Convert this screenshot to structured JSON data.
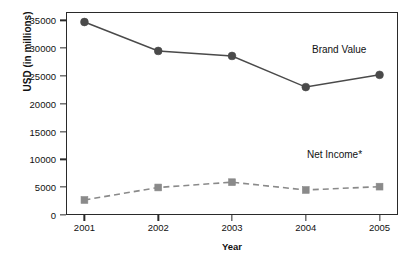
{
  "chart_data": {
    "type": "line",
    "title": "",
    "xlabel": "Year",
    "ylabel": "USD (in millions)",
    "categories": [
      "2001",
      "2002",
      "2003",
      "2004",
      "2005"
    ],
    "x": [
      2001,
      2002,
      2003,
      2004,
      2005
    ],
    "xlim": [
      2000.75,
      2005.25
    ],
    "ylim": [
      0,
      36500
    ],
    "yticks": [
      0,
      5000,
      10000,
      15000,
      20000,
      25000,
      30000,
      35000
    ],
    "ytick_labels": [
      "0",
      "5000",
      "10000",
      "15000",
      "20000",
      "25000",
      "30000",
      "35000"
    ],
    "grid": false,
    "legend_position": "inline-annotations",
    "series": [
      {
        "name": "Brand Value",
        "values": [
          34700,
          29500,
          28600,
          23000,
          25200
        ],
        "marker": "circle",
        "line_style": "solid",
        "color": "#4a4a4a"
      },
      {
        "name": "Net Income*",
        "values": [
          2700,
          4950,
          5900,
          4500,
          5100
        ],
        "marker": "square",
        "line_style": "dashed",
        "color": "#8a8a8a"
      }
    ],
    "annotations": [
      {
        "text": "Brand Value",
        "series": "Brand Value"
      },
      {
        "text": "Net Income*",
        "series": "Net Income*"
      }
    ]
  },
  "colors": {
    "background": "#ffffff",
    "axis": "#2a2a2a",
    "text": "#111111",
    "brand_value": "#4a4a4a",
    "net_income": "#8a8a8a"
  }
}
